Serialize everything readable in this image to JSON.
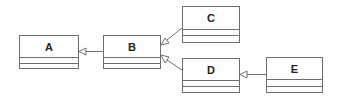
{
  "diagram": {
    "type": "uml-class-diagram",
    "line_color": "#6e6e6e",
    "classes": [
      {
        "id": "A",
        "name": "A",
        "x": 19,
        "y": 35,
        "w": 60,
        "h": 34,
        "div1": 21,
        "div2": 27
      },
      {
        "id": "B",
        "name": "B",
        "x": 103,
        "y": 35,
        "w": 58,
        "h": 34,
        "div1": 21,
        "div2": 27
      },
      {
        "id": "C",
        "name": "C",
        "x": 182,
        "y": 6,
        "w": 58,
        "h": 37,
        "div1": 22,
        "div2": 28
      },
      {
        "id": "D",
        "name": "D",
        "x": 182,
        "y": 58,
        "w": 58,
        "h": 35,
        "div1": 21,
        "div2": 27
      },
      {
        "id": "E",
        "name": "E",
        "x": 266,
        "y": 57,
        "w": 57,
        "h": 36,
        "div1": 21,
        "div2": 28
      }
    ],
    "relations": [
      {
        "type": "generalization",
        "from": "B",
        "to": "A"
      },
      {
        "type": "generalization",
        "from": "C",
        "to": "B"
      },
      {
        "type": "generalization",
        "from": "D",
        "to": "B"
      },
      {
        "type": "generalization",
        "from": "E",
        "to": "D"
      }
    ]
  }
}
